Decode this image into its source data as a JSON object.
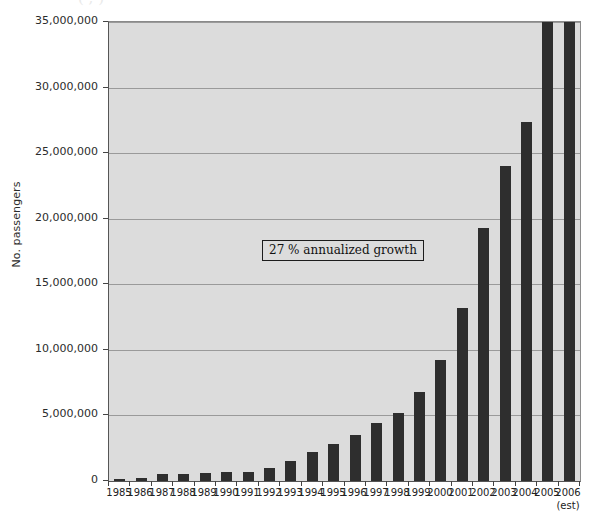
{
  "title_clipped": "( , )",
  "annotation": {
    "text": "27 % annualized growth"
  },
  "axes": {
    "y_title": "No. passengers",
    "x_note": "(est)",
    "y_ticks": [
      "0",
      "5,000,000",
      "10,000,000",
      "15,000,000",
      "20,000,000",
      "25,000,000",
      "30,000,000",
      "35,000,000"
    ]
  },
  "chart_data": {
    "type": "bar",
    "title": "",
    "xlabel": "",
    "ylabel": "No. passengers",
    "ylim": [
      0,
      35000000
    ],
    "ytick_values": [
      0,
      5000000,
      10000000,
      15000000,
      20000000,
      25000000,
      30000000,
      35000000
    ],
    "grid": true,
    "legend": "none",
    "annotations": [
      {
        "text": "27 % annualized growth",
        "x": "1994",
        "y": 17500000
      }
    ],
    "categories": [
      "1985",
      "1986",
      "1987",
      "1988",
      "1989",
      "1990",
      "1991",
      "1992",
      "1993",
      "1994",
      "1995",
      "1996",
      "1997",
      "1998",
      "1999",
      "2000",
      "2001",
      "2002",
      "2003",
      "2004",
      "2005",
      "2006"
    ],
    "category_notes": {
      "2006": "(est)"
    },
    "values": [
      150000,
      250000,
      500000,
      550000,
      600000,
      700000,
      650000,
      1000000,
      1500000,
      2200000,
      2800000,
      3500000,
      4400000,
      5200000,
      6800000,
      9200000,
      13200000,
      19300000,
      24000000,
      27400000,
      35000000,
      35000000
    ],
    "series": [
      {
        "name": "No. passengers",
        "values": [
          150000,
          250000,
          500000,
          550000,
          600000,
          700000,
          650000,
          1000000,
          1500000,
          2200000,
          2800000,
          3500000,
          4400000,
          5200000,
          6800000,
          9200000,
          13200000,
          19300000,
          24000000,
          27400000,
          35000000,
          35000000
        ]
      }
    ],
    "bar_color": "#2e2e2e",
    "plot_background": "#dcdcdc"
  }
}
